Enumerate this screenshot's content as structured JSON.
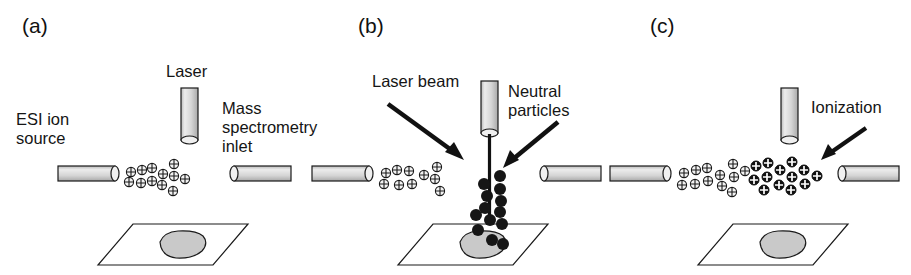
{
  "figure": {
    "width": 911,
    "height": 275,
    "background": "#ffffff"
  },
  "colors": {
    "ink": "#111111",
    "outline": "#1a1a1a",
    "cylinder_fill_light": "#e6e6e6",
    "cylinder_fill_mid": "#cfcfcf",
    "cylinder_fill_dark": "#b5b5b5",
    "sample_fill": "#c9c9c9",
    "ion_fill": "#f2f2f2",
    "neutral_fill": "#161616",
    "black_ion_fill": "#111111"
  },
  "panels": [
    {
      "id": "a",
      "label": "(a)",
      "labels": [
        {
          "name": "laser-label",
          "text": "Laser"
        },
        {
          "name": "esi-source-label",
          "text": "ESI ion\nsource"
        },
        {
          "name": "ms-inlet-label",
          "text": "Mass\nspectrometry\ninlet"
        }
      ],
      "elements": {
        "laser_cylinder": true,
        "esi_tube": true,
        "ms_inlet_tube": true,
        "sample_plate": true,
        "sample_spot": true,
        "ion_plume": true,
        "laser_beam": false,
        "neutral_particles": false,
        "ionized_particles": false
      },
      "ion_count": 12,
      "arrows": []
    },
    {
      "id": "b",
      "label": "(b)",
      "labels": [
        {
          "name": "laser-beam-label",
          "text": "Laser beam"
        },
        {
          "name": "neutral-particles-label",
          "text": "Neutral\nparticles"
        }
      ],
      "elements": {
        "laser_cylinder": true,
        "esi_tube": true,
        "ms_inlet_tube": true,
        "sample_plate": true,
        "sample_spot": true,
        "ion_plume": true,
        "laser_beam": true,
        "neutral_particles": true,
        "ionized_particles": false
      },
      "ion_count": 10,
      "neutral_count": 13,
      "arrows": [
        {
          "name": "laser-beam-arrow",
          "direction": "down-right"
        },
        {
          "name": "neutral-particles-arrow",
          "direction": "down-left"
        }
      ]
    },
    {
      "id": "c",
      "label": "(c)",
      "labels": [
        {
          "name": "ionization-label",
          "text": "Ionization"
        }
      ],
      "elements": {
        "laser_cylinder": true,
        "esi_tube": true,
        "ms_inlet_tube": true,
        "sample_plate": true,
        "sample_spot": true,
        "ion_plume": true,
        "laser_beam": false,
        "neutral_particles": false,
        "ionized_particles": true
      },
      "ion_count": 12,
      "black_ion_count": 13,
      "arrows": [
        {
          "name": "ionization-arrow",
          "direction": "down-left"
        }
      ]
    }
  ]
}
